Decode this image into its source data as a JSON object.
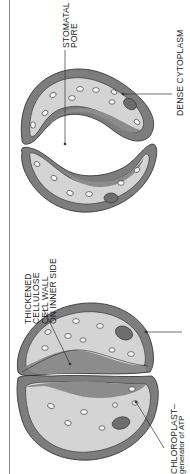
{
  "diagram": {
    "colors": {
      "cell_wall": "#7d7d7d",
      "cytoplasm": "#d4d4d4",
      "thick_wall": "#8c8c8c",
      "chloroplast": "#f5f5f5",
      "nucleus": "#6e6e6e",
      "outline": "#2a2a2a",
      "line": "#333333"
    },
    "labels": {
      "stomatal_pore": [
        "STOMATAL",
        "PORE"
      ],
      "dense_cytoplasm": "DENSE CYTOPLASM",
      "thickened_wall": [
        "THICKENED",
        "CELLULOSE",
        "CELL WALL",
        "ON INNER SIDE"
      ],
      "chloroplast": [
        "CHLOROPLAST–",
        "generator of ATP"
      ]
    },
    "states": [
      "open stoma (top)",
      "closed stoma (bottom)"
    ]
  }
}
